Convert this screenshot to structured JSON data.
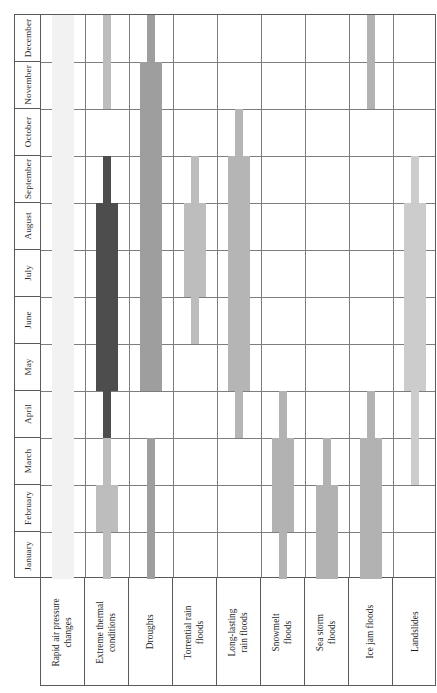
{
  "chart_data": {
    "type": "bar",
    "title": "",
    "xlabel": "",
    "ylabel": "",
    "orientation": "vertical-gantt",
    "grid": true,
    "legend": "none",
    "categories": [
      "Rapid air pressure changes",
      "Extreme thermal conditions",
      "Droughts",
      "Torrential rain floods",
      "Long-lasting rain floods",
      "Snowmelt floods",
      "Sea storm floods",
      "Ice jam floods",
      "Landslides"
    ],
    "months": [
      "January",
      "February",
      "March",
      "April",
      "May",
      "June",
      "July",
      "August",
      "September",
      "October",
      "November",
      "December"
    ],
    "ylim": [
      "January",
      "December"
    ],
    "note": "Each hazard column shows wide segments = peak occurrence months, narrow segments = extended occurrence months. Month axis runs January (bottom) to December (top).",
    "series": [
      {
        "name": "Rapid air pressure changes",
        "color": "#f2f2f2",
        "segments": [
          {
            "kind": "wide",
            "from_month": "January",
            "to_month": "November",
            "from_index": 0,
            "to_index": 11
          }
        ]
      },
      {
        "name": "Extreme thermal conditions",
        "color": "#4d4d4d",
        "color_secondary": "#b8b8b8",
        "segments": [
          {
            "kind": "thin",
            "from_month": "January",
            "to_month": "March",
            "from_index": 0,
            "to_index": 2,
            "color": "#bdbdbd"
          },
          {
            "kind": "wide",
            "from_month": "February",
            "to_month": "February",
            "from_index": 1,
            "to_index": 1,
            "color": "#bdbdbd"
          },
          {
            "kind": "thin",
            "from_month": "April",
            "to_month": "September",
            "from_index": 3,
            "to_index": 8,
            "color": "#4d4d4d"
          },
          {
            "kind": "wide",
            "from_month": "May",
            "to_month": "August",
            "from_index": 4,
            "to_index": 7,
            "color": "#4d4d4d"
          },
          {
            "kind": "thin",
            "from_month": "November",
            "to_month": "December",
            "from_index": 10,
            "to_index": 11,
            "color": "#bdbdbd"
          }
        ]
      },
      {
        "name": "Droughts",
        "color": "#9e9e9e",
        "segments": [
          {
            "kind": "thin",
            "from_month": "January",
            "to_month": "March",
            "from_index": 0,
            "to_index": 2
          },
          {
            "kind": "thin",
            "from_month": "May",
            "to_month": "December",
            "from_index": 4,
            "to_index": 11
          },
          {
            "kind": "wide",
            "from_month": "May",
            "to_month": "November",
            "from_index": 4,
            "to_index": 10
          }
        ]
      },
      {
        "name": "Torrential rain floods",
        "color": "#bdbdbd",
        "segments": [
          {
            "kind": "thin",
            "from_month": "June",
            "to_month": "September",
            "from_index": 5,
            "to_index": 8
          },
          {
            "kind": "wide",
            "from_month": "July",
            "to_month": "August",
            "from_index": 6,
            "to_index": 7
          }
        ]
      },
      {
        "name": "Long-lasting rain floods",
        "color": "#b5b5b5",
        "segments": [
          {
            "kind": "thin",
            "from_month": "April",
            "to_month": "October",
            "from_index": 3,
            "to_index": 9
          },
          {
            "kind": "wide",
            "from_month": "May",
            "to_month": "September",
            "from_index": 4,
            "to_index": 8
          }
        ]
      },
      {
        "name": "Snowmelt floods",
        "color": "#b2b2b2",
        "segments": [
          {
            "kind": "thin",
            "from_month": "January",
            "to_month": "April",
            "from_index": 0,
            "to_index": 3
          },
          {
            "kind": "wide",
            "from_month": "February",
            "to_month": "March",
            "from_index": 1,
            "to_index": 2
          }
        ]
      },
      {
        "name": "Sea storm floods",
        "color": "#b2b2b2",
        "segments": [
          {
            "kind": "thin",
            "from_month": "February",
            "to_month": "March",
            "from_index": 1,
            "to_index": 2
          },
          {
            "kind": "wide",
            "from_month": "January",
            "to_month": "February",
            "from_index": 0,
            "to_index": 1
          }
        ]
      },
      {
        "name": "Ice jam floods",
        "color": "#b2b2b2",
        "segments": [
          {
            "kind": "thin",
            "from_month": "January",
            "to_month": "April",
            "from_index": 0,
            "to_index": 3
          },
          {
            "kind": "wide",
            "from_month": "January",
            "to_month": "March",
            "from_index": 0,
            "to_index": 2
          },
          {
            "kind": "thin",
            "from_month": "November",
            "to_month": "December",
            "from_index": 10,
            "to_index": 11
          }
        ]
      },
      {
        "name": "Landslides",
        "color": "#cccccc",
        "segments": [
          {
            "kind": "thin",
            "from_month": "March",
            "to_month": "September",
            "from_index": 2,
            "to_index": 8
          },
          {
            "kind": "wide",
            "from_month": "May",
            "to_month": "August",
            "from_index": 4,
            "to_index": 7
          }
        ]
      }
    ]
  }
}
